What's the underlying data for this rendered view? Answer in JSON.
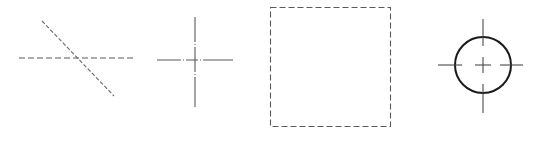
{
  "figures": [
    {
      "id": "dashed-lines-intersecting",
      "description": "Horizontal dashed line crossed by diagonal dashed line"
    },
    {
      "id": "center-line-cross",
      "description": "Center-line (dash-dot) crosshair"
    },
    {
      "id": "dashed-rectangle",
      "description": "Rectangle drawn with dashed (hidden) lines"
    },
    {
      "id": "circle-with-center-lines",
      "description": "Solid circle with center-line crosshair"
    }
  ],
  "colors": {
    "line": "#5a5a5a",
    "circle": "#1a1a1a",
    "background": "#ffffff"
  }
}
